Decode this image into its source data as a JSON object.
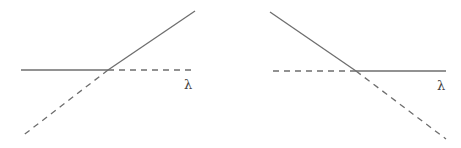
{
  "colors": {
    "line": "#6e6e6e",
    "label": "#444444",
    "background": "#ffffff"
  },
  "panels": [
    {
      "name": "left-diagram",
      "label": "λ",
      "solid": [
        {
          "x1": 21,
          "y1": 70,
          "x2": 108,
          "y2": 70
        },
        {
          "x1": 108,
          "y1": 70,
          "x2": 195,
          "y2": 11
        }
      ],
      "dashed": [
        {
          "x1": 108,
          "y1": 70,
          "x2": 192,
          "y2": 70
        },
        {
          "x1": 108,
          "y1": 70,
          "x2": 21,
          "y2": 137
        }
      ],
      "label_pos": {
        "x": 184,
        "y": 89
      }
    },
    {
      "name": "right-diagram",
      "label": "λ",
      "solid": [
        {
          "x1": 270,
          "y1": 12,
          "x2": 356,
          "y2": 71
        },
        {
          "x1": 356,
          "y1": 71,
          "x2": 446,
          "y2": 71
        }
      ],
      "dashed": [
        {
          "x1": 273,
          "y1": 71,
          "x2": 356,
          "y2": 71
        },
        {
          "x1": 356,
          "y1": 71,
          "x2": 446,
          "y2": 139
        }
      ],
      "label_pos": {
        "x": 437,
        "y": 90
      }
    }
  ]
}
